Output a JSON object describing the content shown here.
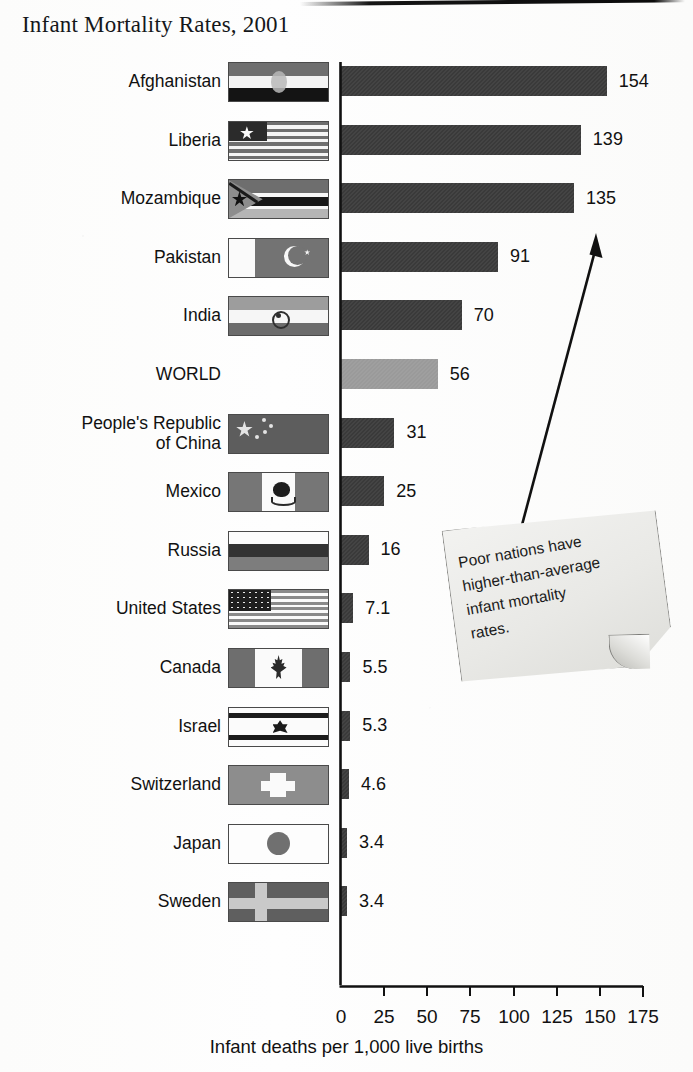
{
  "title": "Infant Mortality Rates, 2001",
  "annotation": {
    "line1": "Poor nations have",
    "line2": "higher-than-average",
    "line3": "infant mortality",
    "line4": "rates.",
    "full": "Poor nations have higher-than-average infant mortality rates."
  },
  "chart_data": {
    "type": "bar",
    "orientation": "horizontal",
    "title": "Infant Mortality Rates, 2001",
    "xlabel": "Infant deaths per 1,000 live births",
    "ylabel": "",
    "xlim": [
      0,
      175
    ],
    "xticks": [
      0,
      25,
      50,
      75,
      100,
      125,
      150,
      175
    ],
    "ticklabels": [
      "0",
      "25",
      "50",
      "75",
      "100",
      "125",
      "150",
      "175"
    ],
    "grid": false,
    "legend": false,
    "annotations": [
      "Poor nations have higher-than-average infant mortality rates."
    ],
    "categories": [
      "Afghanistan",
      "Liberia",
      "Mozambique",
      "Pakistan",
      "India",
      "WORLD",
      "People's Republic of China",
      "Mexico",
      "Russia",
      "United States",
      "Canada",
      "Israel",
      "Switzerland",
      "Japan",
      "Sweden"
    ],
    "values": [
      154,
      139,
      135,
      91,
      70,
      56,
      31,
      25,
      16,
      7.1,
      5.5,
      5.3,
      4.6,
      3.4,
      3.4
    ],
    "value_labels": [
      "154",
      "139",
      "135",
      "91",
      "70",
      "56",
      "31",
      "25",
      "16",
      "7.1",
      "5.5",
      "5.3",
      "4.6",
      "3.4",
      "3.4"
    ],
    "rows": [
      {
        "label": "Afghanistan",
        "label_lines": [
          "Afghanistan"
        ],
        "value": 154,
        "value_label": "154",
        "flag": "flag-afghanistan",
        "highlight": false
      },
      {
        "label": "Liberia",
        "label_lines": [
          "Liberia"
        ],
        "value": 139,
        "value_label": "139",
        "flag": "flag-liberia",
        "highlight": false
      },
      {
        "label": "Mozambique",
        "label_lines": [
          "Mozambique"
        ],
        "value": 135,
        "value_label": "135",
        "flag": "flag-mozambique",
        "highlight": false
      },
      {
        "label": "Pakistan",
        "label_lines": [
          "Pakistan"
        ],
        "value": 91,
        "value_label": "91",
        "flag": "flag-pakistan",
        "highlight": false
      },
      {
        "label": "India",
        "label_lines": [
          "India"
        ],
        "value": 70,
        "value_label": "70",
        "flag": "flag-india",
        "highlight": false
      },
      {
        "label": "WORLD",
        "label_lines": [
          "WORLD"
        ],
        "value": 56,
        "value_label": "56",
        "flag": null,
        "highlight": true
      },
      {
        "label": "People's Republic of China",
        "label_lines": [
          "People's Republic",
          "of China"
        ],
        "value": 31,
        "value_label": "31",
        "flag": "flag-china",
        "highlight": false
      },
      {
        "label": "Mexico",
        "label_lines": [
          "Mexico"
        ],
        "value": 25,
        "value_label": "25",
        "flag": "flag-mexico",
        "highlight": false
      },
      {
        "label": "Russia",
        "label_lines": [
          "Russia"
        ],
        "value": 16,
        "value_label": "16",
        "flag": "flag-russia",
        "highlight": false
      },
      {
        "label": "United States",
        "label_lines": [
          "United States"
        ],
        "value": 7.1,
        "value_label": "7.1",
        "flag": "flag-united-states",
        "highlight": false
      },
      {
        "label": "Canada",
        "label_lines": [
          "Canada"
        ],
        "value": 5.5,
        "value_label": "5.5",
        "flag": "flag-canada",
        "highlight": false
      },
      {
        "label": "Israel",
        "label_lines": [
          "Israel"
        ],
        "value": 5.3,
        "value_label": "5.3",
        "flag": "flag-israel",
        "highlight": false
      },
      {
        "label": "Switzerland",
        "label_lines": [
          "Switzerland"
        ],
        "value": 4.6,
        "value_label": "4.6",
        "flag": "flag-switzerland",
        "highlight": false
      },
      {
        "label": "Japan",
        "label_lines": [
          "Japan"
        ],
        "value": 3.4,
        "value_label": "3.4",
        "flag": "flag-japan",
        "highlight": false
      },
      {
        "label": "Sweden",
        "label_lines": [
          "Sweden"
        ],
        "value": 3.4,
        "value_label": "3.4",
        "flag": "flag-sweden",
        "highlight": false
      }
    ]
  },
  "colors": {
    "bar": "#3a3a3a",
    "bar_world": "#9a9a9a",
    "axis": "#111111",
    "text": "#111111",
    "note_paper": "#eceae6"
  }
}
